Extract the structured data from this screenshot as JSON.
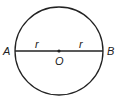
{
  "diagram": {
    "type": "circle-diameter",
    "circle": {
      "cx": 59,
      "cy": 51,
      "r": 44,
      "stroke": "#222222"
    },
    "diameter": {
      "x1": 15,
      "x2": 103,
      "y": 51
    },
    "center_point": {
      "label": "O"
    },
    "endpoints": [
      {
        "label": "A"
      },
      {
        "label": "B"
      }
    ],
    "segment_labels": [
      {
        "label": "r"
      },
      {
        "label": "r"
      }
    ]
  }
}
